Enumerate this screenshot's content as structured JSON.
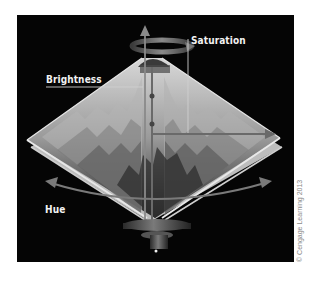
{
  "figure": {
    "labels": {
      "saturation": "Saturation",
      "brightness": "Brightness",
      "hue": "Hue"
    },
    "copyright": "© Cengage Learning 2013",
    "colors": {
      "panel_background": "#050505",
      "page_background": "#ffffff",
      "label_text": "#f2f2f2",
      "arrow": "#7a7a7a"
    },
    "axes": [
      {
        "name": "brightness",
        "direction": "vertical",
        "icon": "arrow-up-icon"
      },
      {
        "name": "saturation",
        "direction": "radial-horizontal",
        "icon": "arrow-right-icon"
      },
      {
        "name": "hue",
        "direction": "circular",
        "icon": "curved-double-arrow-icon"
      }
    ]
  }
}
